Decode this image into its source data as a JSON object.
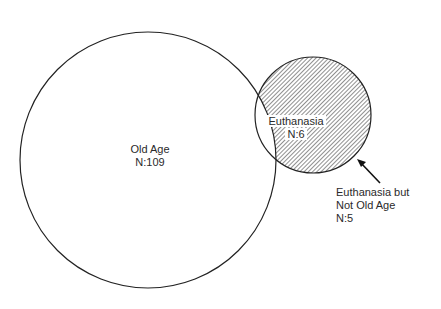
{
  "diagram": {
    "type": "venn",
    "sets": [
      {
        "name": "Old Age",
        "label": "Old Age",
        "count_label": "N:109",
        "count": 109
      },
      {
        "name": "Euthanasia",
        "label": "Euthanasia",
        "count_label": "N:6",
        "count": 6
      }
    ],
    "annotation": {
      "line1": "Euthanasia but",
      "line2": "Not Old Age",
      "line3": "N:5",
      "count": 5
    },
    "colors": {
      "stroke": "#222222",
      "hatch": "#333333",
      "background": "#ffffff"
    }
  }
}
